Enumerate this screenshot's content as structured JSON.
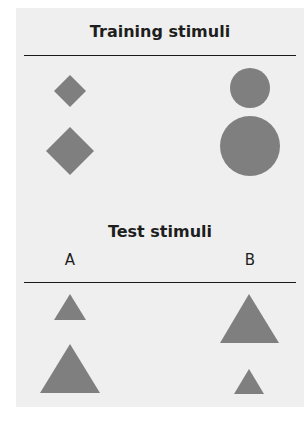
{
  "training": {
    "title": "Training stimuli",
    "columns": [
      {
        "id": "left",
        "shape": "diamond",
        "items": [
          {
            "size": "small",
            "cx": 70,
            "cy": 91,
            "half_diagonal": 16
          },
          {
            "size": "large",
            "cx": 70,
            "cy": 151,
            "half_diagonal": 24
          }
        ]
      },
      {
        "id": "right",
        "shape": "circle",
        "items": [
          {
            "size": "small",
            "cx": 250,
            "cy": 88,
            "r": 20
          },
          {
            "size": "large",
            "cx": 250,
            "cy": 146,
            "r": 30
          }
        ]
      }
    ]
  },
  "test": {
    "title": "Test stimuli",
    "columns": [
      {
        "id": "A",
        "label": "A",
        "shape": "triangle",
        "items": [
          {
            "size": "small",
            "points": "70,294 54,320 86,320"
          },
          {
            "size": "large",
            "points": "70,344 40,393 100,393"
          }
        ]
      },
      {
        "id": "B",
        "label": "B",
        "shape": "triangle",
        "items": [
          {
            "size": "large",
            "points": "249,294 220,343 279,343"
          },
          {
            "size": "small",
            "points": "249,369 234,394 264,394"
          }
        ]
      }
    ]
  },
  "colors": {
    "panel_background": "#efefef",
    "shape_fill": "#7f7f7f",
    "text": "#1e1e1e",
    "rule": "#1a1a1a"
  }
}
